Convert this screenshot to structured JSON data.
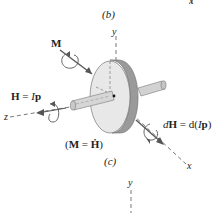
{
  "figure": {
    "top_fragment_label": "x",
    "caption_b": "(b)",
    "caption_c": "(c)",
    "axes": {
      "y": "y",
      "z": "z",
      "x": "x",
      "bottom_y": "y"
    },
    "labels": {
      "moment": "M",
      "angular_momentum": {
        "lhs": "H",
        "eq": " = ",
        "rhs_I": "I",
        "rhs_p": "p"
      },
      "differential": {
        "d1": "d",
        "H": "H",
        "eq": " = d(",
        "I": "I",
        "p": "p",
        "close": ")"
      },
      "relation": {
        "open": "(",
        "M": "M",
        "eq": " = ",
        "Hdot": "Ḣ",
        "close": ")"
      }
    },
    "colors": {
      "ink": "#222222",
      "disc_face": "#e6e6e6",
      "disc_rim": "#9a9a9a",
      "shaft": "#d2d2d2",
      "axis_dash": "#555555"
    }
  }
}
